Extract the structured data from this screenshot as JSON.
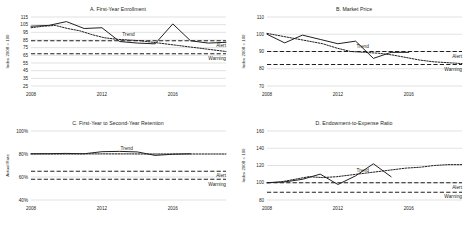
{
  "figure": {
    "panel_count": 4,
    "annotation_labels": {
      "trend": "Trend",
      "alert": "Alert",
      "warning": "Warning"
    }
  },
  "chart_data": [
    {
      "id": "A",
      "type": "line",
      "title": "A. First-Year Enrollment",
      "xlabel": "",
      "ylabel": "Index 2008 = 100",
      "ylim": [
        25,
        115
      ],
      "yticks": [
        115,
        105,
        95,
        85,
        75,
        65,
        55,
        45,
        35,
        25
      ],
      "ytick_labels": [
        "115",
        "105",
        "95",
        "85",
        "75",
        "65",
        "55",
        "45",
        "35",
        "25"
      ],
      "xlim": [
        2008,
        2019
      ],
      "xticks": [
        2008,
        2012,
        2016
      ],
      "xtick_labels": [
        "2008",
        "2012",
        "2016"
      ],
      "grid": "horizontal",
      "legend": "inline-annotations",
      "x": [
        2008,
        2009,
        2010,
        2011,
        2012,
        2013,
        2014,
        2015,
        2016,
        2017,
        2018,
        2019
      ],
      "series": [
        {
          "name": "Actual",
          "style": "solid",
          "values": [
            103,
            104,
            109,
            100,
            101,
            83,
            81,
            80,
            106,
            84,
            81,
            82
          ]
        },
        {
          "name": "Trend",
          "style": "dotted",
          "values": [
            101,
            103,
            104,
            100,
            97,
            92,
            88,
            86,
            85,
            84,
            82,
            80,
            78,
            76,
            74,
            72,
            70
          ]
        }
      ],
      "thresholds": [
        {
          "name": "Alert",
          "value": 84,
          "style": "dashed"
        },
        {
          "name": "Warning",
          "value": 67,
          "style": "dashed"
        }
      ]
    },
    {
      "id": "B",
      "type": "line",
      "title": "B. Market Price",
      "xlabel": "",
      "ylabel": "Index 2008 = 100",
      "ylim": [
        70,
        110
      ],
      "yticks": [
        110,
        100,
        90,
        80,
        70
      ],
      "ytick_labels": [
        "110",
        "100",
        "90",
        "80",
        "70"
      ],
      "xlim": [
        2008,
        2019
      ],
      "xticks": [
        2008,
        2012,
        2016
      ],
      "xtick_labels": [
        "2008",
        "2012",
        "2016"
      ],
      "grid": "horizontal",
      "legend": "inline-annotations",
      "x": [
        2008,
        2009,
        2010,
        2011,
        2012,
        2013,
        2014,
        2015,
        2016
      ],
      "series": [
        {
          "name": "Actual",
          "style": "solid",
          "values": [
            100,
            95,
            99.5,
            97,
            94.5,
            96,
            86,
            89.5,
            89.5
          ]
        },
        {
          "name": "Trend",
          "style": "dotted",
          "values": [
            100.5,
            99,
            97.5,
            96,
            94.5,
            92,
            90,
            89.5,
            89,
            88,
            86.5,
            85,
            84,
            83.5,
            83
          ]
        }
      ],
      "thresholds": [
        {
          "name": "Alert",
          "value": 90,
          "style": "dashed"
        },
        {
          "name": "Warning",
          "value": 82.5,
          "style": "dashed"
        }
      ]
    },
    {
      "id": "C",
      "type": "line",
      "title": "C. First-Year to Second-Year Retention",
      "xlabel": "",
      "ylabel": "Actual Rate",
      "ylim": [
        40,
        100
      ],
      "yticks": [
        100,
        80,
        60,
        40
      ],
      "ytick_labels": [
        "100%",
        "80%",
        "60%",
        "40%"
      ],
      "xlim": [
        2008,
        2019
      ],
      "xticks": [
        2008,
        2012,
        2016
      ],
      "xtick_labels": [
        "2008",
        "2012",
        "2016"
      ],
      "grid": "horizontal",
      "legend": "inline-annotations",
      "x": [
        2008,
        2009,
        2010,
        2011,
        2012,
        2013,
        2014,
        2015,
        2016,
        2017
      ],
      "series": [
        {
          "name": "Actual",
          "style": "solid",
          "values": [
            80.2,
            80.3,
            80.5,
            80.2,
            82.0,
            82.3,
            81.8,
            78.8,
            79.8,
            80.2
          ]
        },
        {
          "name": "Trend",
          "style": "dotted",
          "values": [
            80.0,
            80.0,
            80.0,
            80.0,
            80.1,
            80.1,
            80.1,
            80.1,
            80.0,
            80.0,
            80.0,
            80.0,
            80.0,
            80.0,
            80.0
          ]
        }
      ],
      "thresholds": [
        {
          "name": "Alert",
          "value": 65,
          "style": "dashed"
        },
        {
          "name": "Warning",
          "value": 58,
          "style": "dashed"
        }
      ]
    },
    {
      "id": "D",
      "type": "line",
      "title": "D. Endowment-to-Expense Ratio",
      "xlabel": "",
      "ylabel": "Index 2008 = 100",
      "ylim": [
        80,
        160
      ],
      "yticks": [
        160,
        140,
        120,
        100,
        80
      ],
      "ytick_labels": [
        "160",
        "140",
        "120",
        "100",
        "80"
      ],
      "xlim": [
        2008,
        2019
      ],
      "xticks": [
        2008,
        2012,
        2016
      ],
      "xtick_labels": [
        "2008",
        "2012",
        "2016"
      ],
      "grid": "horizontal",
      "legend": "inline-annotations",
      "x": [
        2008,
        2009,
        2010,
        2011,
        2012,
        2013,
        2014,
        2015
      ],
      "series": [
        {
          "name": "Actual",
          "style": "solid",
          "values": [
            100,
            101,
            104,
            110,
            98,
            108,
            122,
            107
          ]
        },
        {
          "name": "Trend",
          "style": "dotted",
          "values": [
            100,
            101,
            104,
            107,
            106,
            107,
            109,
            111,
            113,
            115,
            117,
            118,
            120,
            121,
            121
          ]
        }
      ],
      "thresholds": [
        {
          "name": "Alert",
          "value": 100,
          "style": "dashed"
        },
        {
          "name": "Warning",
          "value": 89,
          "style": "dashed"
        }
      ]
    }
  ]
}
